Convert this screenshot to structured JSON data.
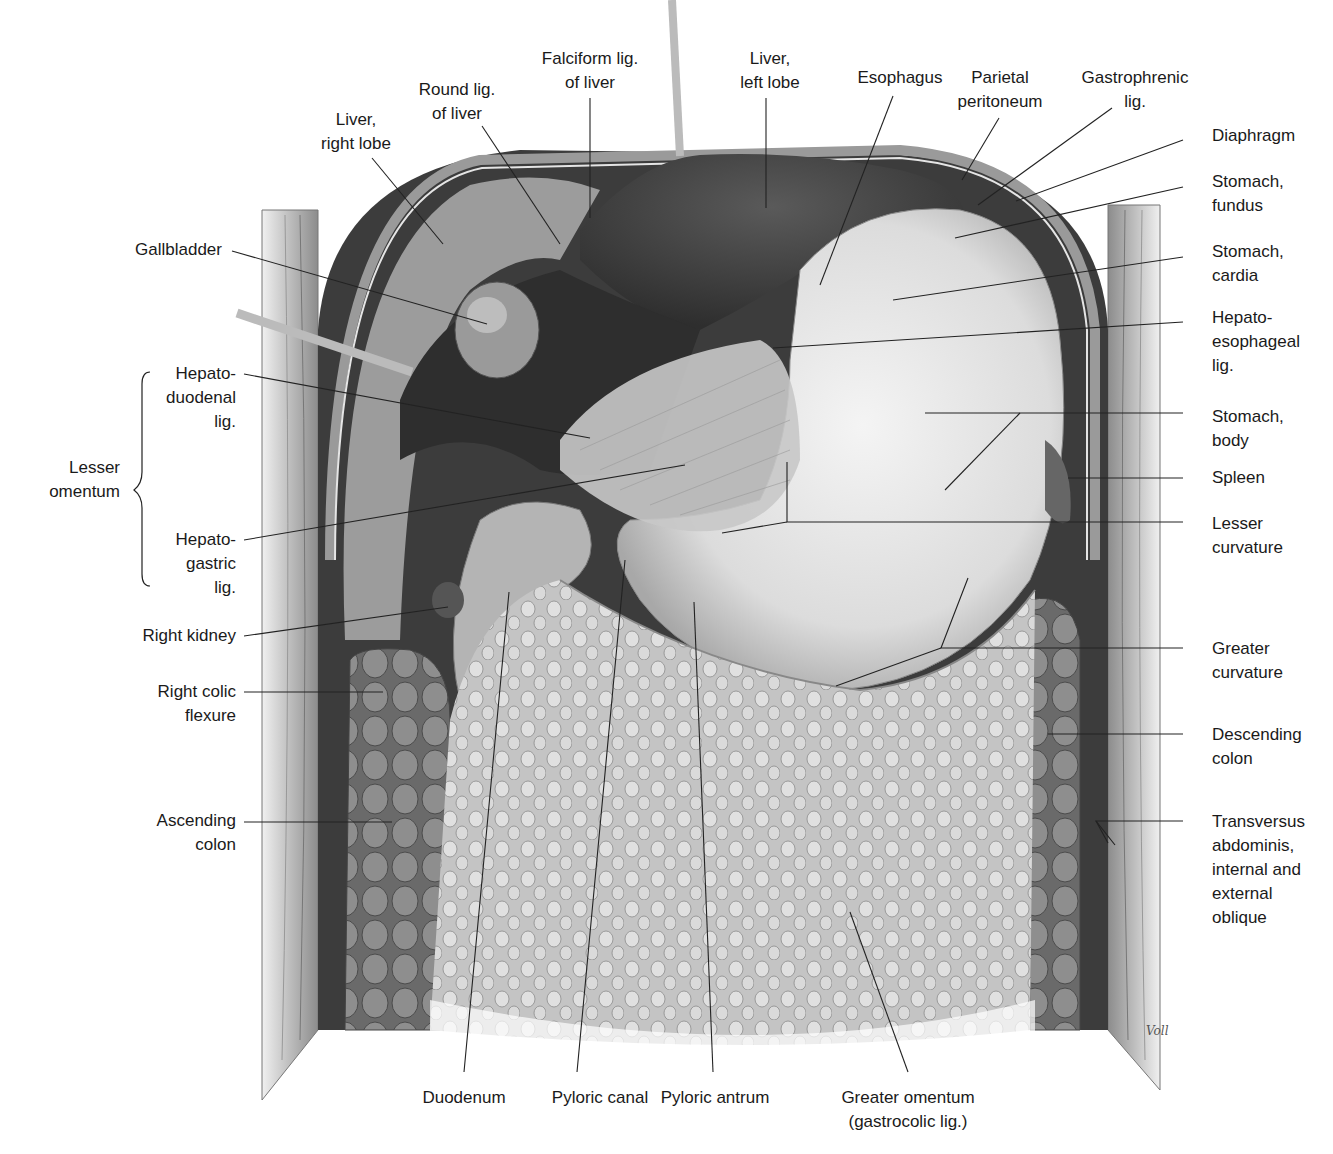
{
  "figure": {
    "signature": "Voll",
    "colors": {
      "background": "#ffffff",
      "label_text": "#1a1a1a",
      "leader_line": "#222222",
      "organ_dark": "#3a3a3a",
      "organ_mid": "#8a8a8a",
      "organ_light": "#e6e6e6"
    }
  },
  "labels": {
    "top": [
      {
        "id": "liver-right-lobe",
        "text": "Liver,\nright lobe"
      },
      {
        "id": "round-lig-of-liver",
        "text": "Round lig.\nof liver"
      },
      {
        "id": "falciform-lig-of-liver",
        "text": "Falciform lig.\nof liver"
      },
      {
        "id": "liver-left-lobe",
        "text": "Liver,\nleft lobe"
      },
      {
        "id": "esophagus",
        "text": "Esophagus"
      },
      {
        "id": "parietal-peritoneum",
        "text": "Parietal\nperitoneum"
      },
      {
        "id": "gastrophrenic-lig",
        "text": "Gastrophrenic\nlig."
      }
    ],
    "left": [
      {
        "id": "gallbladder",
        "text": "Gallbladder"
      },
      {
        "id": "hepatoduodenal-lig",
        "text": "Hepato-\nduodenal\nlig."
      },
      {
        "id": "lesser-omentum",
        "text": "Lesser\nomentum"
      },
      {
        "id": "hepatogastric-lig",
        "text": "Hepato-\ngastric\nlig."
      },
      {
        "id": "right-kidney",
        "text": "Right kidney"
      },
      {
        "id": "right-colic-flexure",
        "text": "Right colic\nflexure"
      },
      {
        "id": "ascending-colon",
        "text": "Ascending\ncolon"
      }
    ],
    "right": [
      {
        "id": "diaphragm",
        "text": "Diaphragm"
      },
      {
        "id": "stomach-fundus",
        "text": "Stomach,\nfundus"
      },
      {
        "id": "stomach-cardia",
        "text": "Stomach,\ncardia"
      },
      {
        "id": "hepatoesophageal-lig",
        "text": "Hepato-\nesophageal\nlig."
      },
      {
        "id": "stomach-body",
        "text": "Stomach,\nbody"
      },
      {
        "id": "spleen",
        "text": "Spleen"
      },
      {
        "id": "lesser-curvature",
        "text": "Lesser\ncurvature"
      },
      {
        "id": "greater-curvature",
        "text": "Greater\ncurvature"
      },
      {
        "id": "descending-colon",
        "text": "Descending\ncolon"
      },
      {
        "id": "abdominal-wall-muscles",
        "text": "Transversus\nabdominis,\ninternal and\nexternal\noblique"
      }
    ],
    "bottom": [
      {
        "id": "duodenum",
        "text": "Duodenum"
      },
      {
        "id": "pyloric-canal",
        "text": "Pyloric canal"
      },
      {
        "id": "pyloric-antrum",
        "text": "Pyloric antrum"
      },
      {
        "id": "greater-omentum",
        "text": "Greater omentum\n(gastrocolic lig.)"
      }
    ]
  }
}
